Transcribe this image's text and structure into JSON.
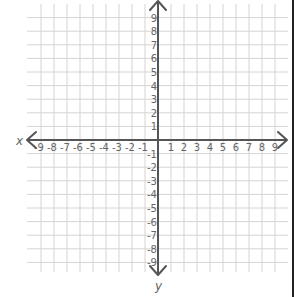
{
  "chart_data": {
    "type": "coordinate-plane",
    "title": "",
    "xlabel": "x",
    "ylabel": "y",
    "xlim": [
      -9,
      9
    ],
    "ylim": [
      -9,
      9
    ],
    "x_ticks": [
      -9,
      -8,
      -7,
      -6,
      -5,
      -4,
      -3,
      -2,
      -1,
      1,
      2,
      3,
      4,
      5,
      6,
      7,
      8,
      9
    ],
    "y_ticks": [
      9,
      8,
      7,
      6,
      5,
      4,
      3,
      2,
      1,
      -1,
      -2,
      -3,
      -4,
      -5,
      -6,
      -7,
      -8,
      -9
    ],
    "grid": true,
    "axis_arrows": true,
    "points": []
  },
  "axes": {
    "x_label": "x",
    "y_label": "y"
  },
  "colors": {
    "grid": "#d4d4d4",
    "axis": "#555555",
    "label": "#666666",
    "border": "#222222"
  },
  "layout": {
    "origin_x": 158,
    "origin_y": 140,
    "step_x": 13,
    "step_y": 13.6
  }
}
